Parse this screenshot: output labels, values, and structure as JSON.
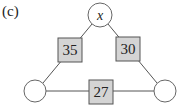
{
  "figure": {
    "panel_label": "(c)",
    "nodes": [
      {
        "id": "top",
        "label": "x"
      },
      {
        "id": "bottom-left",
        "label": ""
      },
      {
        "id": "bottom-right",
        "label": ""
      }
    ],
    "edges": [
      {
        "from": "top",
        "to": "bottom-left",
        "weight": "35"
      },
      {
        "from": "top",
        "to": "bottom-right",
        "weight": "30"
      },
      {
        "from": "bottom-left",
        "to": "bottom-right",
        "weight": "27"
      }
    ],
    "colors": {
      "box_fill": "#d4d4d4",
      "stroke": "#555555",
      "node_fill": "#ffffff"
    }
  }
}
